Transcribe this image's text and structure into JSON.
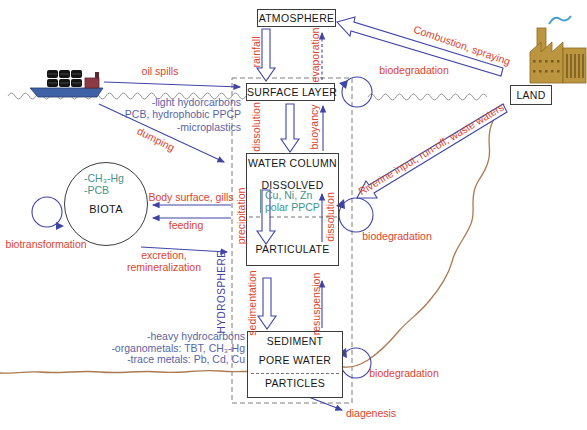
{
  "boxes": {
    "atmosphere": "ATMOSPHERE",
    "surface_layer": "SURFACE LAYER",
    "water_column": "WATER COLUMN",
    "dissolved": "DISSOLVED",
    "particulate": "PARTICULATE",
    "sediment": "SEDIMENT",
    "pore_water": "PORE WATER",
    "particles": "PARTICLES",
    "biota": "BIOTA",
    "land": "LAND"
  },
  "zones": {
    "hydrosphere": "HYDROSPHERE"
  },
  "flows": {
    "rainfall": "rainfall",
    "evaporation": "evaporation",
    "combustion": "Combustion, spraying",
    "biodegradation": "biodegradation",
    "oil_spills": "oil spills",
    "dumping": "dumping",
    "dissolution": "dissolution",
    "buoyancy": "buoyancy",
    "riverine": "Riverine input, run-off, waste waters",
    "precipitation": "precipitation",
    "body_surface": "Body surface, gills",
    "feeding": "feeding",
    "excretion_line1": "excretion,",
    "excretion_line2": "remineralization",
    "biotransformation": "biotransformation",
    "sedimentation": "sedimentation",
    "resuspension": "resuspension",
    "diagenesis": "diagenesis"
  },
  "pollutants": {
    "surface_layer": [
      "-light hydorcarbons",
      "-PCB, hydrophobic PPCP",
      "-microplastics"
    ],
    "dissolved": [
      "Cu, Ni, Zn",
      "polar PPCP"
    ],
    "biota": [
      "-CH₃-Hg",
      "-PCB"
    ],
    "sediment": [
      "-heavy hydrocarbons",
      "-organometals: TBT, CH₃-Hg",
      "-trace metals: Pb, Cd, Cu"
    ]
  },
  "icons": {
    "ship": "cargo-ship",
    "factory": "factory"
  },
  "colors": {
    "process_label": "#dc432f",
    "arrow": "#4045a5",
    "chemical_list": "#5a64a4",
    "chemical_in_box": "#3f948c",
    "coastline": "#ad7a52",
    "sea_wave": "#9a9a9a"
  }
}
